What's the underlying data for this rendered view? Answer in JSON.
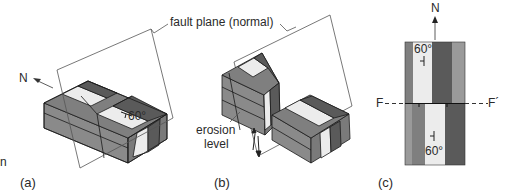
{
  "figure": {
    "callouts": {
      "fault_plane": "fault plane (normal)",
      "erosion_level_line1": "erosion",
      "erosion_level_line2": "level"
    },
    "panels": [
      {
        "id": "a",
        "label": "(a)",
        "north_label": "N",
        "dip_label": "60°"
      },
      {
        "id": "b",
        "label": "(b)"
      },
      {
        "id": "c",
        "label": "(c)",
        "north_label": "N",
        "fault_left": "F",
        "fault_right": "F´",
        "dip_top": "60°",
        "dip_bottom": "60°"
      }
    ],
    "edge_fragment": "n",
    "colors": {
      "dark": "#5a5a5a",
      "medium": "#7f7f7f",
      "mid_light": "#9a9a9a",
      "light": "#ececec",
      "outline": "#1a1a1a",
      "plane": "#555555"
    }
  }
}
